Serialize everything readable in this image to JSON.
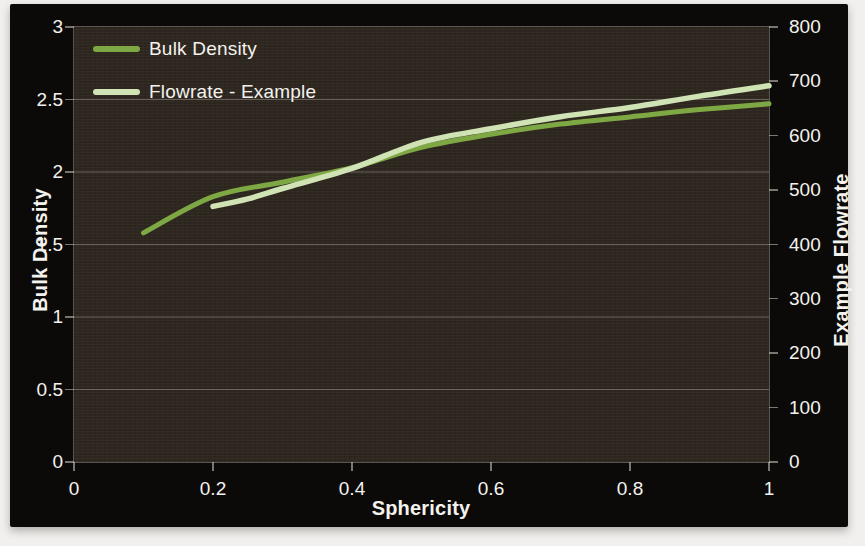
{
  "colors": {
    "chart_background": "#0b0a08",
    "plot_background": "#2e2720",
    "gridline": "#9a948c",
    "tick": "#d6d0c6",
    "text": "#f4f2ee",
    "bulk_density_line": "#7ea843",
    "flowrate_line": "#cfe3b4"
  },
  "chart_data": {
    "type": "line",
    "title": "",
    "xlabel": "Sphericity",
    "ylabel_left": "Bulk Density",
    "ylabel_right": "Example Flowrate",
    "x_range": [
      0,
      1
    ],
    "y_left_range": [
      0,
      3
    ],
    "y_right_range": [
      0,
      800
    ],
    "x_ticks": [
      0,
      0.2,
      0.4,
      0.6,
      0.8,
      1
    ],
    "x_tick_labels": [
      "0",
      "0.2",
      "0.4",
      "0.6",
      "0.8",
      "1"
    ],
    "y_left_ticks": [
      0,
      0.5,
      1,
      1.5,
      2,
      2.5,
      3
    ],
    "y_left_tick_labels": [
      "0",
      "0.5",
      "1",
      "1.5",
      "2",
      "2.5",
      "3"
    ],
    "y_right_ticks": [
      0,
      100,
      200,
      300,
      400,
      500,
      600,
      700,
      800
    ],
    "y_right_tick_labels": [
      "0",
      "100",
      "200",
      "300",
      "400",
      "500",
      "600",
      "700",
      "800"
    ],
    "grid": true,
    "legend_position": "top-left",
    "legend": [
      {
        "label": "Bulk Density",
        "color": "#7ea843"
      },
      {
        "label": "Flowrate - Example",
        "color": "#cfe3b4"
      }
    ],
    "series": [
      {
        "name": "Bulk Density",
        "axis": "left",
        "color": "#7ea843",
        "x": [
          0.1,
          0.2,
          0.3,
          0.4,
          0.5,
          0.6,
          0.7,
          0.8,
          0.9,
          1.0
        ],
        "y": [
          1.58,
          1.83,
          1.93,
          2.03,
          2.17,
          2.26,
          2.33,
          2.38,
          2.43,
          2.47
        ]
      },
      {
        "name": "Flowrate - Example",
        "axis": "right",
        "color": "#cfe3b4",
        "x": [
          0.2,
          0.25,
          0.3,
          0.4,
          0.5,
          0.6,
          0.7,
          0.8,
          0.9,
          1.0
        ],
        "y": [
          470,
          484,
          503,
          540,
          588,
          613,
          635,
          652,
          673,
          692
        ]
      }
    ]
  }
}
